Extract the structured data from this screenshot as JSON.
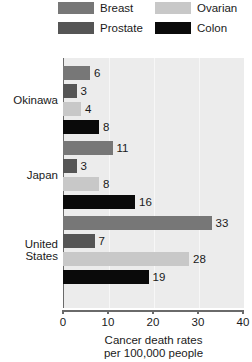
{
  "chart_data": {
    "type": "bar",
    "orientation": "horizontal",
    "title": "",
    "xlabel": "Cancer death rates per 100,000 people",
    "ylabel": "",
    "xlim": [
      0,
      40
    ],
    "xticks": [
      0,
      10,
      20,
      30,
      40
    ],
    "grid": true,
    "legend_position": "top",
    "categories": [
      "Okinawa",
      "Japan",
      "United States"
    ],
    "series": [
      {
        "name": "Breast",
        "color": "#777777",
        "values": [
          6,
          11,
          33
        ]
      },
      {
        "name": "Prostate",
        "color": "#555555",
        "values": [
          3,
          3,
          7
        ]
      },
      {
        "name": "Ovarian",
        "color": "#c8c8c8",
        "values": [
          4,
          8,
          28
        ]
      },
      {
        "name": "Colon",
        "color": "#0a0a0a",
        "values": [
          8,
          16,
          19
        ]
      }
    ]
  },
  "legend": {
    "items": [
      {
        "label": "Breast"
      },
      {
        "label": "Prostate"
      },
      {
        "label": "Ovarian"
      },
      {
        "label": "Colon"
      }
    ]
  },
  "axis": {
    "ticks": [
      {
        "label": "0"
      },
      {
        "label": "10"
      },
      {
        "label": "20"
      },
      {
        "label": "30"
      },
      {
        "label": "40"
      }
    ]
  },
  "groups": [
    {
      "label": "Okinawa",
      "label_line1": "Okinawa",
      "label_line2": "",
      "bars": [
        {
          "series": "Breast",
          "value": 6,
          "value_label": "6"
        },
        {
          "series": "Prostate",
          "value": 3,
          "value_label": "3"
        },
        {
          "series": "Ovarian",
          "value": 4,
          "value_label": "4"
        },
        {
          "series": "Colon",
          "value": 8,
          "value_label": "8"
        }
      ]
    },
    {
      "label": "Japan",
      "label_line1": "Japan",
      "label_line2": "",
      "bars": [
        {
          "series": "Breast",
          "value": 11,
          "value_label": "11"
        },
        {
          "series": "Prostate",
          "value": 3,
          "value_label": "3"
        },
        {
          "series": "Ovarian",
          "value": 8,
          "value_label": "8"
        },
        {
          "series": "Colon",
          "value": 16,
          "value_label": "16"
        }
      ]
    },
    {
      "label": "United States",
      "label_line1": "United",
      "label_line2": "States",
      "bars": [
        {
          "series": "Breast",
          "value": 33,
          "value_label": "33"
        },
        {
          "series": "Prostate",
          "value": 7,
          "value_label": "7"
        },
        {
          "series": "Ovarian",
          "value": 28,
          "value_label": "28"
        },
        {
          "series": "Colon",
          "value": 19,
          "value_label": "19"
        }
      ]
    }
  ],
  "caption": {
    "line1": "Cancer death rates",
    "line2": "per 100,000 people"
  }
}
